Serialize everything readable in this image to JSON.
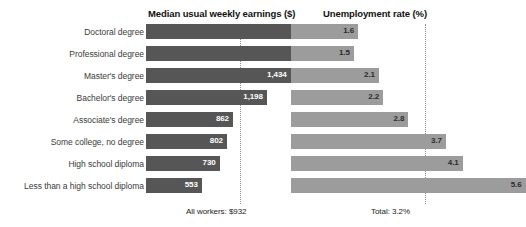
{
  "headers": {
    "earnings": "Median usual weekly earnings ($)",
    "unemployment": "Unemployment rate (%)"
  },
  "notes": {
    "all_workers": "All workers: $932",
    "total": "Total: 3.2%"
  },
  "colors": {
    "earnings_bar": "#565656",
    "unemployment_bar": "#9c9c9c",
    "refline": "#8e8e8e",
    "label_text": "#3b3b3b"
  },
  "chart_data": {
    "type": "bar",
    "title": "",
    "orientation": "horizontal",
    "categories": [
      "Doctoral degree",
      "Professional degree",
      "Master's degree",
      "Bachelor's degree",
      "Associate's degree",
      "Some college, no degree",
      "High school diploma",
      "Less than a high school diploma"
    ],
    "series": [
      {
        "name": "Median usual weekly earnings ($)",
        "values": [
          1825,
          1884,
          1434,
          1198,
          862,
          802,
          730,
          553
        ],
        "labels": [
          "1,825",
          "1,884",
          "1,434",
          "1,198",
          "862",
          "802",
          "730",
          "553"
        ],
        "reference_value": 932,
        "reference_label": "All workers: $932",
        "xlim": [
          0,
          2000
        ]
      },
      {
        "name": "Unemployment rate (%)",
        "values": [
          1.6,
          1.5,
          2.1,
          2.2,
          2.8,
          3.7,
          4.1,
          5.6
        ],
        "labels": [
          "1.6",
          "1.5",
          "2.1",
          "2.2",
          "2.8",
          "3.7",
          "4.1",
          "5.6"
        ],
        "reference_value": 3.2,
        "reference_label": "Total: 3.2%",
        "xlim": [
          0,
          6.2
        ]
      }
    ],
    "xlabel": "",
    "ylabel": "",
    "grid": false,
    "legend": "none"
  }
}
